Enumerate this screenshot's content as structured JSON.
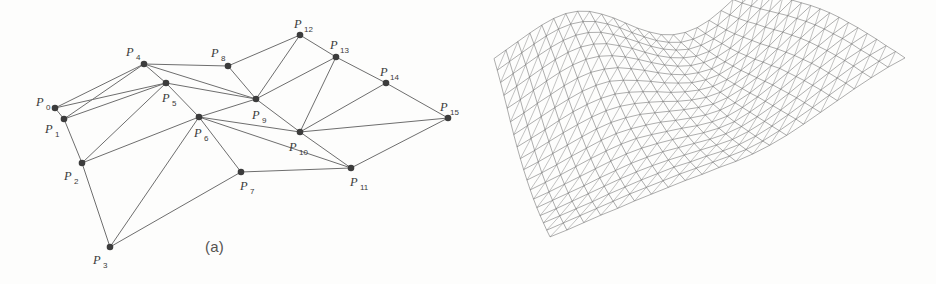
{
  "figure": {
    "background_color": "#fdfdfc",
    "edge_color": "#6e6e6e",
    "vertex_color": "#3c3c3c",
    "caption_color": "#555350"
  },
  "panel_a": {
    "caption": "(a)",
    "label_prefix": "P",
    "points": [
      {
        "id": 0,
        "label": "P",
        "sub": "0",
        "x": 55,
        "y": 108,
        "label_x": 36,
        "label_y": 106,
        "sub_x": 46,
        "sub_y": 110
      },
      {
        "id": 1,
        "label": "P",
        "sub": "1",
        "x": 64,
        "y": 119,
        "label_x": 45,
        "label_y": 133,
        "sub_x": 55,
        "sub_y": 137
      },
      {
        "id": 2,
        "label": "P",
        "sub": "2",
        "x": 82,
        "y": 163,
        "label_x": 64,
        "label_y": 180,
        "sub_x": 74,
        "sub_y": 184
      },
      {
        "id": 3,
        "label": "P",
        "sub": "3",
        "x": 110,
        "y": 247,
        "label_x": 93,
        "label_y": 264,
        "sub_x": 103,
        "sub_y": 268
      },
      {
        "id": 4,
        "label": "P",
        "sub": "4",
        "x": 144,
        "y": 64,
        "label_x": 126,
        "label_y": 56,
        "sub_x": 136,
        "sub_y": 60
      },
      {
        "id": 5,
        "label": "P",
        "sub": "5",
        "x": 166,
        "y": 83,
        "label_x": 162,
        "label_y": 102,
        "sub_x": 172,
        "sub_y": 106
      },
      {
        "id": 6,
        "label": "P",
        "sub": "6",
        "x": 199,
        "y": 117,
        "label_x": 194,
        "label_y": 137,
        "sub_x": 204,
        "sub_y": 141
      },
      {
        "id": 7,
        "label": "P",
        "sub": "7",
        "x": 241,
        "y": 172,
        "label_x": 240,
        "label_y": 190,
        "sub_x": 250,
        "sub_y": 194
      },
      {
        "id": 8,
        "label": "P",
        "sub": "8",
        "x": 228,
        "y": 66,
        "label_x": 211,
        "label_y": 57,
        "sub_x": 221,
        "sub_y": 61
      },
      {
        "id": 9,
        "label": "P",
        "sub": "9",
        "x": 256,
        "y": 99,
        "label_x": 252,
        "label_y": 119,
        "sub_x": 262,
        "sub_y": 123
      },
      {
        "id": 10,
        "label": "P",
        "sub": "10",
        "x": 300,
        "y": 132,
        "label_x": 289,
        "label_y": 151,
        "sub_x": 299,
        "sub_y": 155
      },
      {
        "id": 11,
        "label": "P",
        "sub": "11",
        "x": 351,
        "y": 168,
        "label_x": 350,
        "label_y": 186,
        "sub_x": 360,
        "sub_y": 190
      },
      {
        "id": 12,
        "label": "P",
        "sub": "12",
        "x": 300,
        "y": 35,
        "label_x": 294,
        "label_y": 28,
        "sub_x": 304,
        "sub_y": 32
      },
      {
        "id": 13,
        "label": "P",
        "sub": "13",
        "x": 336,
        "y": 57,
        "label_x": 330,
        "label_y": 49,
        "sub_x": 340,
        "sub_y": 53
      },
      {
        "id": 14,
        "label": "P",
        "sub": "14",
        "x": 386,
        "y": 83,
        "label_x": 380,
        "label_y": 76,
        "sub_x": 390,
        "sub_y": 80
      },
      {
        "id": 15,
        "label": "P",
        "sub": "15",
        "x": 448,
        "y": 118,
        "label_x": 440,
        "label_y": 111,
        "sub_x": 450,
        "sub_y": 115
      }
    ],
    "edges": [
      [
        0,
        1
      ],
      [
        0,
        4
      ],
      [
        0,
        5
      ],
      [
        1,
        2
      ],
      [
        1,
        4
      ],
      [
        1,
        5
      ],
      [
        2,
        3
      ],
      [
        2,
        5
      ],
      [
        2,
        6
      ],
      [
        3,
        6
      ],
      [
        3,
        7
      ],
      [
        4,
        5
      ],
      [
        4,
        8
      ],
      [
        4,
        9
      ],
      [
        5,
        6
      ],
      [
        5,
        9
      ],
      [
        6,
        7
      ],
      [
        6,
        9
      ],
      [
        6,
        10
      ],
      [
        6,
        11
      ],
      [
        7,
        11
      ],
      [
        8,
        9
      ],
      [
        8,
        12
      ],
      [
        9,
        10
      ],
      [
        9,
        12
      ],
      [
        9,
        13
      ],
      [
        10,
        11
      ],
      [
        10,
        13
      ],
      [
        10,
        14
      ],
      [
        10,
        15
      ],
      [
        11,
        15
      ],
      [
        12,
        13
      ],
      [
        13,
        14
      ],
      [
        14,
        15
      ]
    ]
  },
  "panel_b": {
    "caption": "(b)",
    "description": "triangulated saddle surface wireframe",
    "grid_columns": 22,
    "grid_rows": 18,
    "corners": {
      "left": {
        "x": 26,
        "y": 97
      },
      "top": {
        "x": 277,
        "y": 22
      },
      "right": {
        "x": 437,
        "y": 110
      },
      "bottom": {
        "x": 82,
        "y": 253
      }
    },
    "surface_heights": [
      [
        0.62,
        0.7,
        0.78,
        0.86,
        0.93,
        0.98,
        1.0,
        0.98,
        0.92,
        0.82,
        0.7,
        0.56,
        0.42,
        0.3,
        0.2,
        0.14,
        0.12,
        0.14,
        0.2,
        0.3,
        0.42,
        0.55
      ],
      [
        0.58,
        0.66,
        0.74,
        0.82,
        0.89,
        0.94,
        0.96,
        0.94,
        0.88,
        0.78,
        0.66,
        0.52,
        0.39,
        0.27,
        0.18,
        0.12,
        0.11,
        0.14,
        0.21,
        0.32,
        0.45,
        0.58
      ],
      [
        0.53,
        0.61,
        0.69,
        0.77,
        0.84,
        0.89,
        0.91,
        0.89,
        0.83,
        0.73,
        0.61,
        0.48,
        0.35,
        0.24,
        0.16,
        0.11,
        0.11,
        0.15,
        0.23,
        0.35,
        0.49,
        0.62
      ],
      [
        0.47,
        0.55,
        0.63,
        0.71,
        0.78,
        0.83,
        0.85,
        0.83,
        0.77,
        0.67,
        0.56,
        0.43,
        0.31,
        0.21,
        0.14,
        0.1,
        0.11,
        0.17,
        0.26,
        0.39,
        0.53,
        0.67
      ],
      [
        0.41,
        0.48,
        0.56,
        0.64,
        0.71,
        0.76,
        0.78,
        0.76,
        0.7,
        0.61,
        0.5,
        0.38,
        0.27,
        0.18,
        0.12,
        0.1,
        0.12,
        0.19,
        0.3,
        0.44,
        0.58,
        0.72
      ],
      [
        0.34,
        0.41,
        0.49,
        0.56,
        0.63,
        0.68,
        0.7,
        0.68,
        0.63,
        0.54,
        0.44,
        0.33,
        0.23,
        0.15,
        0.11,
        0.1,
        0.14,
        0.22,
        0.34,
        0.48,
        0.63,
        0.77
      ],
      [
        0.28,
        0.35,
        0.42,
        0.49,
        0.55,
        0.6,
        0.62,
        0.61,
        0.55,
        0.47,
        0.38,
        0.28,
        0.2,
        0.13,
        0.1,
        0.11,
        0.17,
        0.26,
        0.38,
        0.53,
        0.68,
        0.81
      ],
      [
        0.23,
        0.29,
        0.35,
        0.42,
        0.48,
        0.52,
        0.54,
        0.53,
        0.48,
        0.41,
        0.33,
        0.24,
        0.17,
        0.12,
        0.1,
        0.13,
        0.2,
        0.3,
        0.43,
        0.58,
        0.72,
        0.85
      ],
      [
        0.19,
        0.24,
        0.3,
        0.36,
        0.41,
        0.45,
        0.47,
        0.46,
        0.42,
        0.36,
        0.29,
        0.21,
        0.15,
        0.11,
        0.11,
        0.16,
        0.24,
        0.35,
        0.48,
        0.62,
        0.76,
        0.88
      ],
      [
        0.16,
        0.2,
        0.25,
        0.3,
        0.35,
        0.39,
        0.41,
        0.4,
        0.37,
        0.31,
        0.25,
        0.19,
        0.14,
        0.11,
        0.13,
        0.19,
        0.28,
        0.39,
        0.52,
        0.66,
        0.79,
        0.9
      ],
      [
        0.14,
        0.17,
        0.21,
        0.26,
        0.3,
        0.34,
        0.36,
        0.35,
        0.32,
        0.28,
        0.22,
        0.17,
        0.13,
        0.12,
        0.15,
        0.22,
        0.32,
        0.44,
        0.56,
        0.69,
        0.81,
        0.91
      ],
      [
        0.13,
        0.16,
        0.19,
        0.23,
        0.27,
        0.3,
        0.32,
        0.32,
        0.29,
        0.25,
        0.21,
        0.16,
        0.13,
        0.13,
        0.18,
        0.26,
        0.36,
        0.47,
        0.59,
        0.71,
        0.82,
        0.91
      ],
      [
        0.13,
        0.15,
        0.18,
        0.21,
        0.24,
        0.27,
        0.29,
        0.29,
        0.27,
        0.24,
        0.2,
        0.16,
        0.14,
        0.15,
        0.21,
        0.29,
        0.39,
        0.5,
        0.62,
        0.73,
        0.83,
        0.91
      ],
      [
        0.14,
        0.16,
        0.18,
        0.2,
        0.23,
        0.25,
        0.27,
        0.27,
        0.26,
        0.23,
        0.2,
        0.17,
        0.16,
        0.18,
        0.24,
        0.32,
        0.42,
        0.53,
        0.64,
        0.74,
        0.83,
        0.9
      ],
      [
        0.16,
        0.17,
        0.19,
        0.21,
        0.23,
        0.25,
        0.26,
        0.26,
        0.25,
        0.23,
        0.21,
        0.19,
        0.18,
        0.21,
        0.27,
        0.35,
        0.45,
        0.55,
        0.65,
        0.75,
        0.82,
        0.89
      ],
      [
        0.19,
        0.2,
        0.21,
        0.22,
        0.24,
        0.25,
        0.26,
        0.26,
        0.26,
        0.24,
        0.23,
        0.21,
        0.21,
        0.24,
        0.3,
        0.38,
        0.47,
        0.57,
        0.66,
        0.75,
        0.82,
        0.87
      ],
      [
        0.22,
        0.23,
        0.24,
        0.25,
        0.26,
        0.27,
        0.27,
        0.27,
        0.27,
        0.26,
        0.25,
        0.24,
        0.24,
        0.27,
        0.33,
        0.41,
        0.49,
        0.58,
        0.67,
        0.74,
        0.81,
        0.86
      ],
      [
        0.26,
        0.26,
        0.27,
        0.28,
        0.28,
        0.29,
        0.29,
        0.29,
        0.29,
        0.28,
        0.28,
        0.27,
        0.28,
        0.31,
        0.36,
        0.43,
        0.51,
        0.59,
        0.67,
        0.74,
        0.8,
        0.84
      ]
    ]
  }
}
